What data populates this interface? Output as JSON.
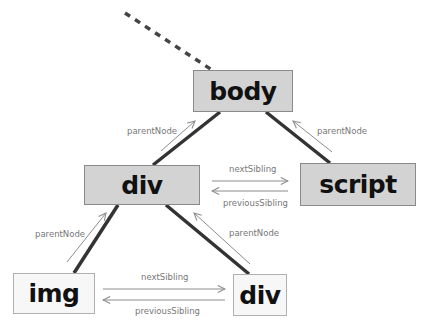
{
  "diagram": {
    "type": "dom-tree",
    "nodes": {
      "body": {
        "label": "body",
        "style": "shaded"
      },
      "div_top": {
        "label": "div",
        "style": "shaded"
      },
      "script": {
        "label": "script",
        "style": "shaded"
      },
      "img": {
        "label": "img",
        "style": "light"
      },
      "div_bottom": {
        "label": "div",
        "style": "light"
      }
    },
    "edges": [
      {
        "from": "body",
        "to": "div_top",
        "kind": "child"
      },
      {
        "from": "body",
        "to": "script",
        "kind": "child"
      },
      {
        "from": "div_top",
        "to": "img",
        "kind": "child"
      },
      {
        "from": "div_top",
        "to": "div_bottom",
        "kind": "child"
      },
      {
        "from": "parent_of_body",
        "to": "body",
        "kind": "ellipsis"
      }
    ],
    "relations": {
      "div_top_parent": "parentNode",
      "script_parent": "parentNode",
      "img_parent": "parentNode",
      "div_bottom_parent": "parentNode",
      "top_next": "nextSibling",
      "top_prev": "previousSibling",
      "bottom_next": "nextSibling",
      "bottom_prev": "previousSibling"
    },
    "colors": {
      "tree_line": "#333333",
      "relation_arrow": "#8c8c8c",
      "shaded_fill": "#d3d3d3",
      "light_fill": "#f7f7f7"
    }
  }
}
